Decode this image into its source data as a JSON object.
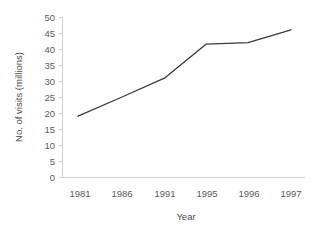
{
  "chart_data": {
    "type": "line",
    "title": "",
    "subtitle": "",
    "xlabel": "Year",
    "ylabel": "No. of visits (millions)",
    "categories": [
      "1981",
      "1986",
      "1991",
      "1995",
      "1996",
      "1997"
    ],
    "values": [
      19,
      25,
      31,
      41.5,
      42,
      46
    ],
    "series": [
      {
        "name": "No. of visits (millions)",
        "values": [
          19,
          25,
          31,
          41.5,
          42,
          46
        ]
      }
    ],
    "ylim": [
      0,
      50
    ],
    "ytick_step": 5,
    "ytick_labels": [
      "0",
      "5",
      "10",
      "15",
      "20",
      "25",
      "30",
      "35",
      "40",
      "45",
      "50"
    ],
    "grid": false,
    "legend": false,
    "legend_position": "none",
    "line_color": "#3a3a3a",
    "axis_color": "#d2d2d2",
    "background_color": "#ffffff",
    "annotations": []
  },
  "axes": {
    "y_title": "No. of visits (millions)",
    "x_title": "Year"
  }
}
